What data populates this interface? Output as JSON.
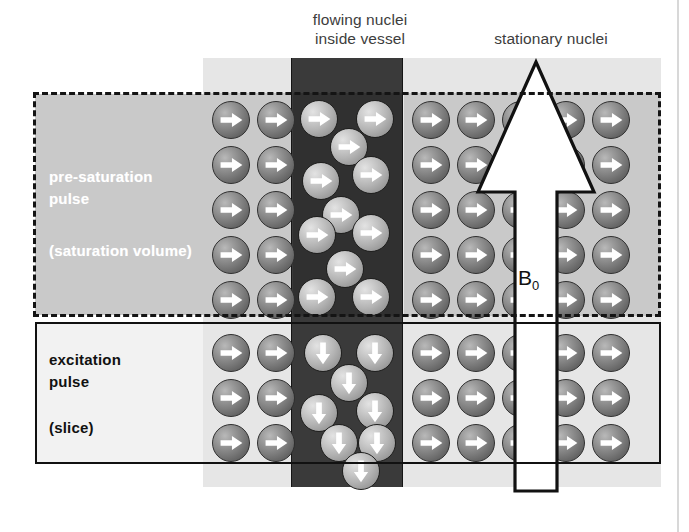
{
  "figure": {
    "title_flowing": "flowing nuclei\ninside vessel",
    "title_stationary": "stationary nuclei",
    "field_label": "B",
    "field_label_sub": "0"
  },
  "saturation_box": {
    "line1": "pre-saturation",
    "line2": "pulse",
    "line3": "(saturation volume)",
    "border_style": "dashed",
    "text_color": "#ffffff",
    "fill_color": "#c9c9c9"
  },
  "excitation_box": {
    "line1": "excitation",
    "line2": "pulse",
    "line3": "(slice)",
    "border_style": "solid",
    "text_color": "#111111",
    "fill_color": "#f2f2f2"
  },
  "colors": {
    "tissue_light": "#e6e6e6",
    "tissue_saturated": "#c9c9c9",
    "vessel_dark": "#3a3a3a",
    "vessel_saturated": "#303030",
    "outline": "#1a1a1a",
    "arrow_fill": "#ffffff",
    "arrow_outline": "#111111",
    "heading_text": "#3d3d3d"
  },
  "regions": {
    "tissue_block": {
      "x": 203,
      "y": 58,
      "w": 458,
      "h": 429
    },
    "vessel_column": {
      "x": 291,
      "y": 58,
      "w": 112,
      "h": 429
    },
    "saturation_volume": {
      "x": 33,
      "y": 92,
      "w": 628,
      "h": 225
    },
    "excitation_slice": {
      "x": 35,
      "y": 322,
      "w": 626,
      "h": 142
    }
  },
  "nuclei": {
    "stationary_left_saturated": {
      "count": 10,
      "rows": 5,
      "cols": 2,
      "spin": "right",
      "shade": "dark",
      "x0": 212,
      "y0": 101,
      "dx": 45,
      "dy": 45
    },
    "stationary_right_saturated": {
      "count": 25,
      "rows": 5,
      "cols": 5,
      "spin": "right",
      "shade": "dark",
      "x0": 412,
      "y0": 101,
      "dx": 45,
      "dy": 45
    },
    "stationary_left_slice": {
      "count": 6,
      "rows": 3,
      "cols": 2,
      "spin": "right",
      "shade": "dark",
      "x0": 212,
      "y0": 334,
      "dx": 45,
      "dy": 45
    },
    "stationary_right_slice": {
      "count": 15,
      "rows": 3,
      "cols": 5,
      "spin": "right",
      "shade": "dark",
      "x0": 412,
      "y0": 334,
      "dx": 45,
      "dy": 45
    },
    "flowing_saturated": {
      "count": 11,
      "spin": "right",
      "shade": "bright",
      "positions": [
        [
          300,
          100
        ],
        [
          356,
          100
        ],
        [
          330,
          128
        ],
        [
          352,
          156
        ],
        [
          302,
          162
        ],
        [
          322,
          196
        ],
        [
          298,
          216
        ],
        [
          352,
          214
        ],
        [
          326,
          250
        ],
        [
          298,
          278
        ],
        [
          352,
          278
        ]
      ]
    },
    "flowing_slice": {
      "count": 8,
      "spin": "down",
      "shade": "bright",
      "positions": [
        [
          304,
          334
        ],
        [
          356,
          334
        ],
        [
          330,
          364
        ],
        [
          300,
          394
        ],
        [
          356,
          392
        ],
        [
          320,
          424
        ],
        [
          358,
          424
        ],
        [
          342,
          452
        ]
      ]
    }
  },
  "b0_arrow": {
    "direction": "up",
    "x": 466,
    "y": 58,
    "w": 140,
    "h": 437,
    "shaft_width": 42,
    "head_width": 116
  }
}
